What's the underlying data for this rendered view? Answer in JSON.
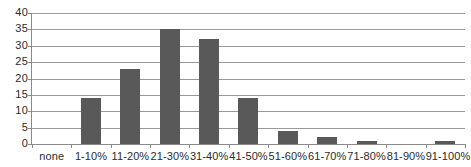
{
  "chart_data": {
    "type": "bar",
    "title": "",
    "subtitle": "",
    "xlabel": "",
    "ylabel": "",
    "categories": [
      "none",
      "1-10%",
      "11-20%",
      "21-30%",
      "31-40%",
      "41-50%",
      "51-60%",
      "61-70%",
      "71-80%",
      "81-90%",
      "91-100%"
    ],
    "values": [
      0,
      14,
      23,
      35,
      32,
      14,
      4,
      2,
      1,
      0,
      1
    ],
    "series": [
      {
        "name": "",
        "values": [
          0,
          14,
          23,
          35,
          32,
          14,
          4,
          2,
          1,
          0,
          1
        ]
      }
    ],
    "ylim": [
      0,
      40
    ],
    "ytick_labels": [
      "0",
      "5",
      "10",
      "15",
      "20",
      "25",
      "30",
      "35",
      "40"
    ],
    "ytick_values": [
      0,
      5,
      10,
      15,
      20,
      25,
      30,
      35,
      40
    ],
    "ytick_step": 5,
    "grid": true,
    "grid_axis": "y",
    "legend": false,
    "legend_position": "none",
    "annotations": [],
    "bar_color": "#595959",
    "gridline_color": "#9a9a9a",
    "axis_color": "#8a8a8a",
    "text_color": "#2b2b2b",
    "background_color": "#ffffff"
  }
}
